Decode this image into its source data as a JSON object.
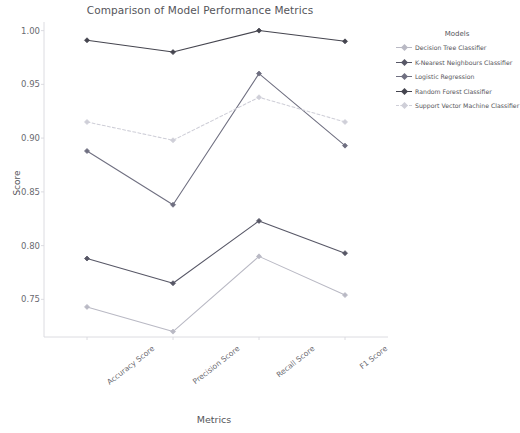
{
  "chart_data": {
    "type": "line",
    "title": "Comparison of Model Performance Metrics",
    "xlabel": "Metrics",
    "ylabel": "Score",
    "categories": [
      "Accuracy Score",
      "Precision Score",
      "Recall Score",
      "F1 Score"
    ],
    "ylim": [
      0.715,
      1.008
    ],
    "yticks": [
      "0.75",
      "0.80",
      "0.85",
      "0.90",
      "0.95",
      "1.00"
    ],
    "ytick_values": [
      0.75,
      0.8,
      0.85,
      0.9,
      0.95,
      1.0
    ],
    "grid": false,
    "legend_position": "right",
    "legend_title": "Models",
    "series": [
      {
        "name": "Decision Tree Classifier",
        "values": [
          0.743,
          0.72,
          0.79,
          0.754
        ],
        "color": "#b9b9c4",
        "marker": "diamond",
        "linestyle": "solid"
      },
      {
        "name": "K-Nearest Neighbours Classifier",
        "values": [
          0.788,
          0.765,
          0.823,
          0.793
        ],
        "color": "#575766",
        "marker": "diamond",
        "linestyle": "solid"
      },
      {
        "name": "Logistic Regression",
        "values": [
          0.888,
          0.838,
          0.96,
          0.893
        ],
        "color": "#6f6f80",
        "marker": "diamond",
        "linestyle": "solid"
      },
      {
        "name": "Random Forest Classifier",
        "values": [
          0.991,
          0.98,
          1.0,
          0.99
        ],
        "color": "#45454f",
        "marker": "diamond",
        "linestyle": "solid"
      },
      {
        "name": "Support Vector Machine Classifier",
        "values": [
          0.915,
          0.898,
          0.938,
          0.915
        ],
        "color": "#cfcfd8",
        "marker": "diamond",
        "linestyle": "dashed"
      }
    ]
  }
}
